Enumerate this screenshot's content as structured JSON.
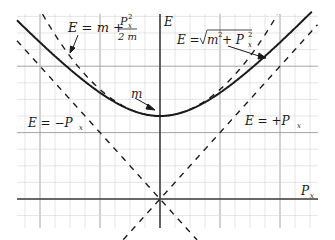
{
  "diagram": {
    "axes": {
      "x_label": "P",
      "x_label_sub": "x",
      "y_label": "E"
    },
    "labels": {
      "classical": {
        "lhs": "E = m + ",
        "num": "P",
        "num_sub": "x",
        "num_sup": "2",
        "den": "2 m"
      },
      "relativistic": {
        "lhs": "E = ",
        "radicand_m": "m",
        "m_sup": "2",
        "plus": " + P",
        "p_sub": "x",
        "p_sup": "2"
      },
      "rest_mass": "m",
      "minus_asymptote": {
        "text": "E = −P",
        "sub": "x"
      },
      "plus_asymptote": {
        "text": "E = +P",
        "sub": "x"
      }
    },
    "colors": {
      "curve": "#1a1a1a",
      "grid_minor": "#d4d4d4",
      "grid_major": "#9a9a9a",
      "axis": "#444444"
    }
  },
  "chart_data": {
    "type": "line",
    "title": "",
    "xlabel": "P_x",
    "ylabel": "E",
    "series": [
      {
        "name": "E = sqrt(m^2 + P_x^2)",
        "style": "solid",
        "formula": "sqrt(1 + p^2)"
      },
      {
        "name": "E = m + P_x^2 / 2m",
        "style": "dashed",
        "formula": "1 + p^2/2"
      },
      {
        "name": "E = +P_x",
        "style": "dashed",
        "formula": "p"
      },
      {
        "name": "E = -P_x",
        "style": "dashed",
        "formula": "-p"
      }
    ],
    "annotations": [
      "m (minimum of hyperbola at P_x = 0)"
    ],
    "grid": true,
    "xlim": [
      -1.9,
      2.1
    ],
    "ylim": [
      -0.5,
      2.4
    ]
  }
}
